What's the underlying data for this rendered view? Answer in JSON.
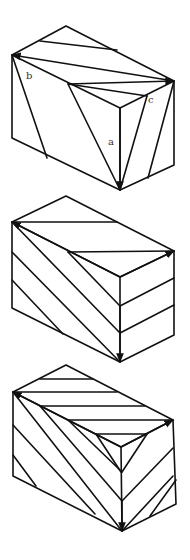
{
  "figure": {
    "width": 190,
    "height": 560,
    "stroke_color": "#111111",
    "background": "#ffffff"
  },
  "blocks": [
    {
      "name": "block-top",
      "outline": [
        [
          66,
          26
        ],
        [
          174,
          81
        ],
        [
          174,
          165
        ],
        [
          120,
          190
        ],
        [
          12,
          138
        ],
        [
          12,
          55
        ],
        [
          66,
          26
        ]
      ],
      "edges": [
        [
          [
            12,
            55
          ],
          [
            120,
            108
          ]
        ],
        [
          [
            120,
            108
          ],
          [
            174,
            81
          ]
        ],
        [
          [
            120,
            108
          ],
          [
            120,
            190
          ]
        ],
        [
          [
            40,
            41
          ],
          [
            117,
            50
          ]
        ],
        [
          [
            12,
            55
          ],
          [
            47,
            158
          ]
        ],
        [
          [
            68,
            84
          ],
          [
            120,
            190
          ]
        ],
        [
          [
            68,
            84
          ],
          [
            147,
            96
          ]
        ],
        [
          [
            147,
            96
          ],
          [
            120,
            190
          ]
        ],
        [
          [
            174,
            81
          ],
          [
            148,
            178
          ]
        ]
      ],
      "arrows": [
        {
          "from": [
            174,
            81
          ],
          "to": [
            12,
            55
          ]
        },
        {
          "from": [
            68,
            84
          ],
          "to": [
            174,
            81
          ]
        },
        {
          "from": [
            120,
            108
          ],
          "to": [
            120,
            190
          ]
        }
      ],
      "labels": [
        {
          "text": "b",
          "x": 26,
          "y": 79
        },
        {
          "text": "c",
          "x": 148,
          "y": 103
        },
        {
          "text": "a",
          "x": 108,
          "y": 145
        }
      ]
    },
    {
      "name": "block-middle",
      "outline": [
        [
          66,
          196
        ],
        [
          174,
          251
        ],
        [
          174,
          335
        ],
        [
          120,
          362
        ],
        [
          12,
          308
        ],
        [
          12,
          222
        ],
        [
          66,
          196
        ]
      ],
      "edges": [
        [
          [
            12,
            222
          ],
          [
            120,
            277
          ]
        ],
        [
          [
            120,
            277
          ],
          [
            174,
            251
          ]
        ],
        [
          [
            120,
            277
          ],
          [
            120,
            362
          ]
        ],
        [
          [
            12,
            222
          ],
          [
            117,
            222
          ]
        ],
        [
          [
            68,
            252
          ],
          [
            174,
            251
          ]
        ],
        [
          [
            68,
            252
          ],
          [
            120,
            306
          ]
        ],
        [
          [
            12,
            222
          ],
          [
            120,
            333
          ]
        ],
        [
          [
            12,
            252
          ],
          [
            120,
            362
          ]
        ],
        [
          [
            12,
            280
          ],
          [
            63,
            334
          ]
        ],
        [
          [
            120,
            306
          ],
          [
            174,
            278
          ]
        ],
        [
          [
            120,
            333
          ],
          [
            174,
            305
          ]
        ]
      ],
      "arrows": [
        {
          "from": [
            120,
            277
          ],
          "to": [
            12,
            222
          ]
        },
        {
          "from": [
            120,
            277
          ],
          "to": [
            174,
            251
          ]
        },
        {
          "from": [
            120,
            306
          ],
          "to": [
            120,
            362
          ]
        }
      ],
      "labels": []
    },
    {
      "name": "block-bottom",
      "outline": [
        [
          66,
          365
        ],
        [
          173,
          420
        ],
        [
          176,
          504
        ],
        [
          122,
          531
        ],
        [
          13,
          476
        ],
        [
          13,
          392
        ],
        [
          66,
          365
        ]
      ],
      "edges": [
        [
          [
            13,
            392
          ],
          [
            121,
            447
          ]
        ],
        [
          [
            121,
            447
          ],
          [
            173,
            420
          ]
        ],
        [
          [
            121,
            447
          ],
          [
            122,
            531
          ]
        ],
        [
          [
            40,
            379
          ],
          [
            93,
            379
          ]
        ],
        [
          [
            13,
            392
          ],
          [
            117,
            392
          ]
        ],
        [
          [
            40,
            406
          ],
          [
            145,
            406
          ]
        ],
        [
          [
            68,
            420
          ],
          [
            173,
            420
          ]
        ],
        [
          [
            96,
            434
          ],
          [
            147,
            434
          ]
        ],
        [
          [
            96,
            434
          ],
          [
            121,
            472
          ]
        ],
        [
          [
            13,
            392
          ],
          [
            122,
            531
          ]
        ],
        [
          [
            13,
            425
          ],
          [
            95,
            514
          ]
        ],
        [
          [
            13,
            455
          ],
          [
            36,
            486
          ]
        ],
        [
          [
            40,
            406
          ],
          [
            122,
            501
          ]
        ],
        [
          [
            68,
            420
          ],
          [
            122,
            472
          ]
        ],
        [
          [
            122,
            472
          ],
          [
            147,
            434
          ]
        ],
        [
          [
            122,
            501
          ],
          [
            173,
            448
          ]
        ],
        [
          [
            122,
            531
          ],
          [
            173,
            476
          ]
        ],
        [
          [
            150,
            516
          ],
          [
            176,
            480
          ]
        ]
      ],
      "arrows": [
        {
          "from": [
            121,
            447
          ],
          "to": [
            13,
            392
          ]
        },
        {
          "from": [
            121,
            447
          ],
          "to": [
            173,
            420
          ]
        },
        {
          "from": [
            122,
            501
          ],
          "to": [
            122,
            531
          ]
        }
      ],
      "labels": []
    }
  ]
}
